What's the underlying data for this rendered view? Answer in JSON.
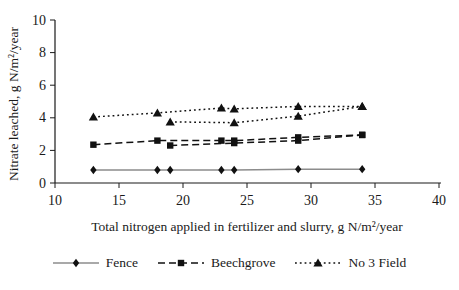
{
  "figure": {
    "background_color": "#ffffff",
    "text_color": "#1a1a1a"
  },
  "chart_data": {
    "type": "line",
    "title": "",
    "xlabel": "Total nitrogen applied in fertilizer and slurry, g N/m²/year",
    "ylabel": "Nitrate leached, g N/m²/year",
    "xlim": [
      10,
      40
    ],
    "ylim": [
      0,
      10
    ],
    "xticks": [
      10,
      15,
      20,
      25,
      30,
      35,
      40
    ],
    "yticks": [
      0,
      2,
      4,
      6,
      8,
      10
    ],
    "grid": false,
    "legend_position": "bottom-center",
    "series": [
      {
        "name": "Fence",
        "marker": "diamond",
        "line_style": "solid",
        "line_color": "#8c8c8c",
        "marker_color": "#111111",
        "lines": [
          [
            [
              13,
              0.8
            ],
            [
              18,
              0.8
            ],
            [
              19,
              0.8
            ],
            [
              23,
              0.8
            ],
            [
              24,
              0.8
            ],
            [
              29,
              0.85
            ],
            [
              34,
              0.85
            ]
          ]
        ]
      },
      {
        "name": "Beechgrove",
        "marker": "square",
        "line_style": "dashed",
        "line_color": "#111111",
        "marker_color": "#111111",
        "lines": [
          [
            [
              13,
              2.35
            ],
            [
              18,
              2.6
            ],
            [
              23,
              2.6
            ],
            [
              24,
              2.6
            ],
            [
              29,
              2.8
            ],
            [
              34,
              2.95
            ]
          ],
          [
            [
              19,
              2.3
            ],
            [
              24,
              2.45
            ],
            [
              29,
              2.6
            ],
            [
              34,
              2.95
            ]
          ]
        ]
      },
      {
        "name": "No 3 Field",
        "marker": "triangle",
        "line_style": "dotted",
        "line_color": "#111111",
        "marker_color": "#111111",
        "lines": [
          [
            [
              13,
              4.05
            ],
            [
              18,
              4.3
            ],
            [
              23,
              4.6
            ],
            [
              24,
              4.55
            ],
            [
              29,
              4.7
            ],
            [
              34,
              4.7
            ]
          ],
          [
            [
              19,
              3.75
            ],
            [
              24,
              3.7
            ],
            [
              29,
              4.1
            ],
            [
              34,
              4.7
            ]
          ]
        ]
      }
    ]
  }
}
